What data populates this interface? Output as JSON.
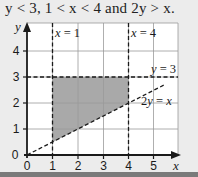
{
  "caption": "y < 3,  1 < x < 4  and  2y > x.",
  "graph": {
    "x_axis_label": "x",
    "y_axis_label": "y",
    "x_ticks": [
      "0",
      "1",
      "2",
      "3",
      "4",
      "5"
    ],
    "y_ticks": [
      "0",
      "1",
      "2",
      "3",
      "4"
    ],
    "lines": [
      {
        "label": "x = 1",
        "type": "dashed-vertical",
        "value": 1
      },
      {
        "label": "x = 4",
        "type": "dashed-vertical",
        "value": 4
      },
      {
        "label": "y = 3",
        "type": "dashed-horizontal",
        "value": 3
      },
      {
        "label": "2y = x",
        "type": "dashed-diagonal"
      }
    ],
    "shaded_region": "1 < x < 4, y < 3, 2y > x",
    "colors": {
      "shade": "#a9a9a9",
      "grid": "#9a9a9a",
      "axis": "#1a1a1a",
      "background": "#ececec",
      "plot": "#ffffff"
    }
  }
}
